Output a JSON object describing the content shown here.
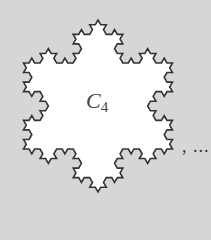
{
  "figure": {
    "background": "#d6d6d6",
    "fill": "#ffffff",
    "stroke": "#333333",
    "label_main": "C",
    "label_sub": "4",
    "trailing_text": ", ...",
    "snowflake": {
      "center_x": 98,
      "center_y": 106,
      "radius": 86,
      "iterations": 3,
      "orientation": "vertex-up"
    }
  }
}
